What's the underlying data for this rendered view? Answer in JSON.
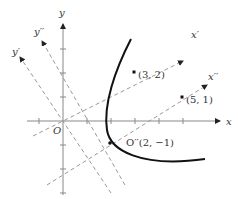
{
  "diagram": {
    "axes": {
      "x_label": "x",
      "y_label": "y",
      "origin_label": "O"
    },
    "rotated_axes": {
      "x_prime_label": "x′",
      "y_prime_label": "y′",
      "x_double_prime_label": "x′′",
      "y_double_prime_label": "y′′"
    },
    "points": [
      {
        "label": "(3, 2)",
        "x": 3,
        "y": 2
      },
      {
        "label": "(5, 1)",
        "x": 5,
        "y": 1
      },
      {
        "label": "O′′(2, −1)",
        "x": 2,
        "y": -1
      }
    ],
    "curve": "parabola",
    "colors": {
      "axis": "#888888",
      "dashed": "#999999",
      "curve": "#111111"
    }
  }
}
